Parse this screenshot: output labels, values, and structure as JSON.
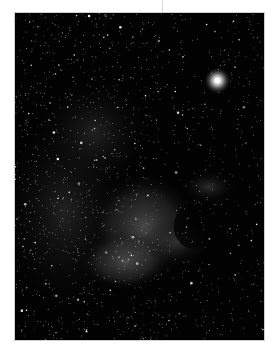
{
  "image": {
    "subject": "North America Nebula star field",
    "colors": {
      "background": "#ffffff",
      "sky": "#020202",
      "nebula": "#6a6a6a",
      "stars": "#ffffff",
      "border": "#cfcfcf"
    },
    "bright_star": {
      "x": 218,
      "y": 80
    }
  }
}
